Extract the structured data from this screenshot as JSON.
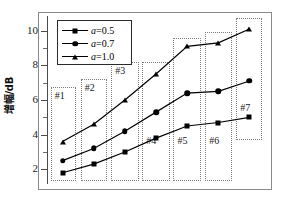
{
  "chart_data": {
    "type": "line",
    "title": "",
    "xlabel": "",
    "ylabel": "增幅/dB",
    "ylim": [
      1.15,
      10.85
    ],
    "yticks": [
      2,
      4,
      6,
      8,
      10
    ],
    "ytick_labels": [
      "2",
      "4",
      "6",
      "8",
      "10"
    ],
    "y_minor_ticks": [
      3,
      5,
      7,
      9
    ],
    "xlim": [
      0.5,
      7.5
    ],
    "x": [
      1,
      2,
      3,
      4,
      5,
      6,
      7
    ],
    "xtick_labels": [],
    "grid": false,
    "legend_position": "upper left",
    "series": [
      {
        "name": "a=0.5",
        "marker": "square",
        "values": [
          1.8,
          2.3,
          3.0,
          3.8,
          4.5,
          4.7,
          5.0
        ]
      },
      {
        "name": "a=0.7",
        "marker": "circle",
        "values": [
          2.5,
          3.2,
          4.2,
          5.3,
          6.4,
          6.5,
          7.1
        ]
      },
      {
        "name": "a=1.0",
        "marker": "triangle",
        "values": [
          3.6,
          4.6,
          6.0,
          7.5,
          9.1,
          9.3,
          10.1
        ]
      }
    ],
    "annotations": [
      {
        "label": "#1",
        "x_range": [
          0.62,
          1.42
        ],
        "y_range": [
          1.3,
          6.75
        ]
      },
      {
        "label": "#2",
        "x_range": [
          1.58,
          2.42
        ],
        "y_range": [
          1.3,
          7.2
        ]
      },
      {
        "label": "#3",
        "x_range": [
          2.56,
          3.46
        ],
        "y_range": [
          1.3,
          8.2
        ]
      },
      {
        "label": "#4",
        "x_range": [
          3.56,
          4.46
        ],
        "y_range": [
          1.3,
          8.2
        ]
      },
      {
        "label": "#5",
        "x_range": [
          4.56,
          5.46
        ],
        "y_range": [
          1.3,
          9.6
        ]
      },
      {
        "label": "#6",
        "x_range": [
          5.58,
          6.44
        ],
        "y_range": [
          1.3,
          9.95
        ]
      },
      {
        "label": "#7",
        "x_range": [
          6.58,
          7.4
        ],
        "y_range": [
          3.7,
          10.75
        ]
      }
    ]
  },
  "legend": {
    "items": [
      {
        "symbol": "a",
        "equals": "=0.5",
        "marker": "square-marker"
      },
      {
        "symbol": "a",
        "equals": "=0.7",
        "marker": "circle-marker"
      },
      {
        "symbol": "a",
        "equals": "=1.0",
        "marker": "triangle-marker"
      }
    ]
  },
  "axis": {
    "y_title": "增幅/dB"
  }
}
